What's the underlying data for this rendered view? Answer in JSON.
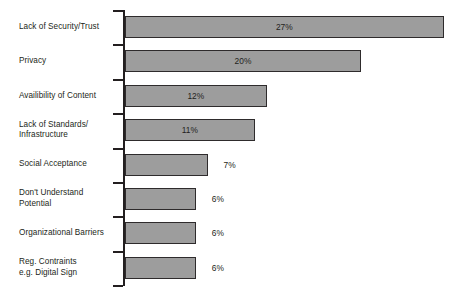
{
  "chart_data": {
    "type": "bar",
    "orientation": "horizontal",
    "title": "",
    "subtitle": "",
    "xlabel": "",
    "ylabel": "",
    "grid": false,
    "legend": "none",
    "xlim": [
      0,
      27
    ],
    "value_suffix": "%",
    "categories": [
      "Lack of Security/Trust",
      "Privacy",
      "Availibility of Content",
      "Lack of Standards/ Infrastructure",
      "Social Acceptance",
      "Don't Understand Potential",
      "Organizational Barriers",
      "Reg. Contraints e.g. Digital Sign"
    ],
    "values": [
      27,
      20,
      12,
      11,
      7,
      6,
      6,
      6
    ],
    "value_labels": [
      "27%",
      "20%",
      "12%",
      "11%",
      "7%",
      "6%",
      "6%",
      "6%"
    ],
    "bars": [
      {
        "label_lines": [
          "Lack of Security/Trust"
        ],
        "value": 27,
        "value_label": "27%",
        "label_position": "inside"
      },
      {
        "label_lines": [
          "Privacy"
        ],
        "value": 20,
        "value_label": "20%",
        "label_position": "inside"
      },
      {
        "label_lines": [
          "Availibility of Content"
        ],
        "value": 12,
        "value_label": "12%",
        "label_position": "inside"
      },
      {
        "label_lines": [
          "Lack of Standards/",
          "Infrastructure"
        ],
        "value": 11,
        "value_label": "11%",
        "label_position": "inside"
      },
      {
        "label_lines": [
          "Social Acceptance"
        ],
        "value": 7,
        "value_label": "7%",
        "label_position": "outside"
      },
      {
        "label_lines": [
          "Don't Understand",
          "Potential"
        ],
        "value": 6,
        "value_label": "6%",
        "label_position": "outside"
      },
      {
        "label_lines": [
          "Organizational Barriers"
        ],
        "value": 6,
        "value_label": "6%",
        "label_position": "outside"
      },
      {
        "label_lines": [
          "Reg. Contraints",
          "e.g. Digital Sign"
        ],
        "value": 6,
        "value_label": "6%",
        "label_position": "outside"
      }
    ],
    "colors": {
      "bar_fill": "#9d9d9d",
      "bar_border": "#2e2b2c",
      "axis": "#231f20",
      "text": "#231f20",
      "background": "#ffffff"
    }
  }
}
